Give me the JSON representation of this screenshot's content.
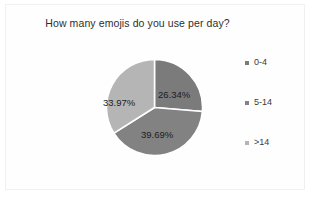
{
  "chart": {
    "title": "How many emojis do you use per day?",
    "frame_border_color": "#f0f0f0",
    "background_color": "#ffffff",
    "title_color": "#2e2e2e"
  },
  "legend": {
    "position": "right",
    "items": [
      {
        "label": "0-4",
        "color": "#7b7b7b",
        "marker": "square-swatch-icon"
      },
      {
        "label": "5-14",
        "color": "#828282",
        "marker": "square-swatch-icon"
      },
      {
        "label": ">14",
        "color": "#b5b5b5",
        "marker": "square-swatch-icon"
      }
    ]
  },
  "slice_labels": [
    {
      "text": "26.34%"
    },
    {
      "text": "39.69%"
    },
    {
      "text": "33.97%"
    }
  ],
  "chart_data": {
    "type": "pie",
    "title": "How many emojis do you use per day?",
    "xlabel": "",
    "ylabel": "",
    "categories": [
      "0-4",
      "5-14",
      ">14"
    ],
    "values": [
      26.34,
      39.69,
      33.97
    ],
    "value_labels": [
      "26.34%",
      "39.69%",
      "33.97%"
    ],
    "unit": "percent",
    "colors": [
      "#7b7b7b",
      "#828282",
      "#b5b5b5"
    ],
    "legend_position": "right",
    "grid": false,
    "start_angle_deg": 0,
    "direction": "clockwise",
    "separator_color": "#ffffff"
  }
}
